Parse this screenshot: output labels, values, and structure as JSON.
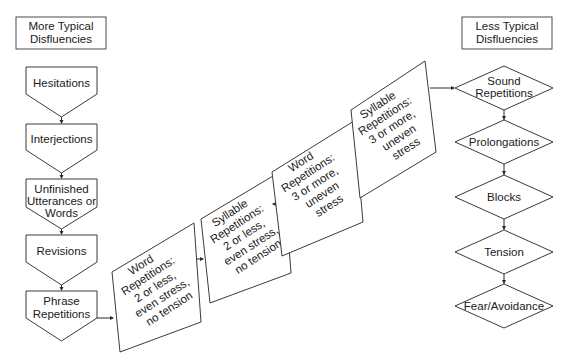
{
  "headers": {
    "left": [
      "More Typical",
      "Disfluencies"
    ],
    "right": [
      "Less Typical",
      "Disfluencies"
    ]
  },
  "left_column": [
    {
      "lines": [
        "Hesitations"
      ]
    },
    {
      "lines": [
        "Interjections"
      ]
    },
    {
      "lines": [
        "Unfinished",
        "Utterances or",
        "Words"
      ]
    },
    {
      "lines": [
        "Revisions"
      ]
    },
    {
      "lines": [
        "Phrase",
        "Repetitions"
      ]
    }
  ],
  "middle_steps": [
    {
      "lines": [
        "Word",
        "Repetitions:",
        "2 or less,",
        "even stress,",
        "no tension"
      ]
    },
    {
      "lines": [
        "Syllable",
        "Repetitions:",
        "2 or less,",
        "even stress,",
        "no tension"
      ]
    },
    {
      "lines": [
        "Word",
        "Repetitions:",
        "3 or more,",
        "uneven",
        "stress"
      ]
    },
    {
      "lines": [
        "Syllable",
        "Repetitions:",
        "3 or more,",
        "uneven",
        "stress"
      ]
    }
  ],
  "right_column": [
    {
      "lines": [
        "Sound",
        "Repetitions"
      ]
    },
    {
      "lines": [
        "Prolongations"
      ]
    },
    {
      "lines": [
        "Blocks"
      ]
    },
    {
      "lines": [
        "Tension"
      ]
    },
    {
      "lines": [
        "Fear/Avoidance"
      ]
    }
  ]
}
